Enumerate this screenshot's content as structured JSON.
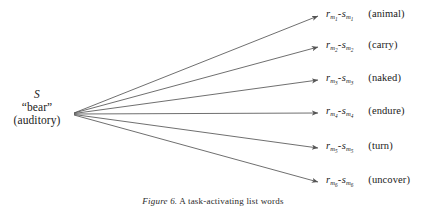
{
  "figure": {
    "background_color": "#ffffff",
    "line_color": "#555555",
    "text_color": "#1a1a1a",
    "width": 426,
    "height": 209
  },
  "stimulus": {
    "symbol": "S",
    "word": "“bear”",
    "modality": "(auditory)",
    "origin_x": 72,
    "origin_y": 114
  },
  "responses": [
    {
      "index": 1,
      "code_r": "r",
      "code_sub_r": "m",
      "code_sub_sub_r": "1",
      "dash": "-",
      "code_s": "s",
      "code_sub_s": "m",
      "code_sub_sub_s": "1",
      "word": "(animal)",
      "y": 16
    },
    {
      "index": 2,
      "code_r": "r",
      "code_sub_r": "m",
      "code_sub_sub_r": "2",
      "dash": "-",
      "code_s": "s",
      "code_sub_s": "m",
      "code_sub_sub_s": "2",
      "word": "(carry)",
      "y": 47
    },
    {
      "index": 3,
      "code_r": "r",
      "code_sub_r": "m",
      "code_sub_sub_r": "3",
      "dash": "-",
      "code_s": "s",
      "code_sub_s": "m",
      "code_sub_sub_s": "3",
      "word": "(naked)",
      "y": 80
    },
    {
      "index": 4,
      "code_r": "r",
      "code_sub_r": "m",
      "code_sub_sub_r": "4",
      "dash": "-",
      "code_s": "s",
      "code_sub_s": "m",
      "code_sub_sub_s": "4",
      "word": "(endure)",
      "y": 113
    },
    {
      "index": 5,
      "code_r": "r",
      "code_sub_r": "m",
      "code_sub_sub_r": "5",
      "dash": "-",
      "code_s": "s",
      "code_sub_s": "m",
      "code_sub_sub_s": "5",
      "word": "(turn)",
      "y": 148
    },
    {
      "index": 6,
      "code_r": "r",
      "code_sub_r": "m",
      "code_sub_sub_r": "6",
      "dash": "-",
      "code_s": "s",
      "code_sub_s": "m",
      "code_sub_sub_s": "6",
      "word": "(uncover)",
      "y": 182
    }
  ],
  "caption": {
    "label": "Figure 6.",
    "text": "A task-activating list words"
  }
}
